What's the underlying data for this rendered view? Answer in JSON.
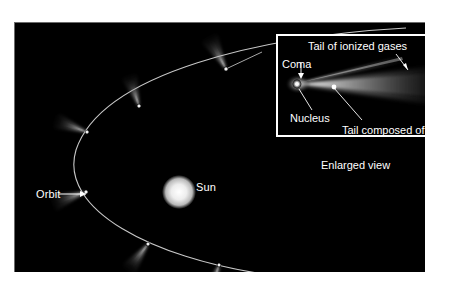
{
  "figure": {
    "background_color": "#ffffff",
    "stage_color": "#000000"
  },
  "main_view": {
    "orbit_label": "Orbit",
    "sun_label": "Sun",
    "orbit_color": "#d8d8d8",
    "sun_color": "#e8e8e8",
    "comet_count": 6
  },
  "inset": {
    "caption": "Enlarged view",
    "border_color": "#ffffff",
    "labels": {
      "ionized_gases": "Tail of ionized gases",
      "coma": "Coma",
      "nucleus": "Nucleus",
      "dust": "Tail composed of dust"
    }
  }
}
